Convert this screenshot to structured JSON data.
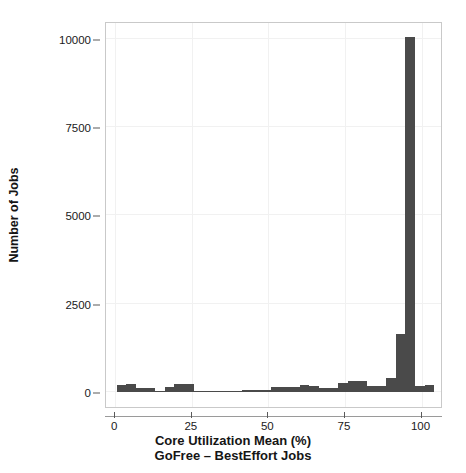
{
  "chart_data": {
    "type": "bar",
    "title": "",
    "subtitle": "",
    "xlabel": "Core Utilization Mean (%)",
    "xlabel_line2": "GoFree – BestEffort Jobs",
    "ylabel": "Number of Jobs",
    "grid": true,
    "legend": "none",
    "bar_color": "#4a4a4a",
    "frame_color": "#c9c9c9",
    "xlim": [
      -3,
      107
    ],
    "ylim": [
      0,
      10500
    ],
    "bin_width": 3.15,
    "xticks": [
      0,
      25,
      50,
      75,
      100
    ],
    "xtick_labels": [
      "0",
      "25",
      "50",
      "75",
      "100"
    ],
    "yticks": [
      0,
      2500,
      5000,
      7500,
      10000
    ],
    "ytick_labels": [
      "0",
      "2500",
      "5000",
      "7500",
      "10000"
    ],
    "bins": [
      {
        "x_start": 0.5,
        "x_end": 3.6,
        "center": 2.0,
        "value": 200
      },
      {
        "x_start": 3.6,
        "x_end": 6.7,
        "center": 5.2,
        "value": 215
      },
      {
        "x_start": 6.7,
        "x_end": 9.9,
        "center": 8.3,
        "value": 115
      },
      {
        "x_start": 9.9,
        "x_end": 13.0,
        "center": 11.5,
        "value": 100
      },
      {
        "x_start": 13.0,
        "x_end": 16.2,
        "center": 14.6,
        "value": 35
      },
      {
        "x_start": 16.2,
        "x_end": 19.3,
        "center": 17.7,
        "value": 150
      },
      {
        "x_start": 19.3,
        "x_end": 22.5,
        "center": 20.9,
        "value": 215
      },
      {
        "x_start": 22.5,
        "x_end": 25.6,
        "center": 24.0,
        "value": 215
      },
      {
        "x_start": 25.6,
        "x_end": 28.7,
        "center": 27.2,
        "value": 30
      },
      {
        "x_start": 28.7,
        "x_end": 31.9,
        "center": 30.3,
        "value": 30
      },
      {
        "x_start": 31.9,
        "x_end": 35.0,
        "center": 33.5,
        "value": 30
      },
      {
        "x_start": 35.0,
        "x_end": 38.2,
        "center": 36.6,
        "value": 30
      },
      {
        "x_start": 38.2,
        "x_end": 41.3,
        "center": 39.7,
        "value": 40
      },
      {
        "x_start": 41.3,
        "x_end": 44.5,
        "center": 42.9,
        "value": 50
      },
      {
        "x_start": 44.5,
        "x_end": 47.6,
        "center": 46.0,
        "value": 45
      },
      {
        "x_start": 47.6,
        "x_end": 50.7,
        "center": 49.2,
        "value": 45
      },
      {
        "x_start": 50.7,
        "x_end": 53.9,
        "center": 52.3,
        "value": 150
      },
      {
        "x_start": 53.9,
        "x_end": 57.0,
        "center": 55.5,
        "value": 150
      },
      {
        "x_start": 57.0,
        "x_end": 60.2,
        "center": 58.6,
        "value": 145
      },
      {
        "x_start": 60.2,
        "x_end": 63.3,
        "center": 61.7,
        "value": 190
      },
      {
        "x_start": 63.3,
        "x_end": 66.4,
        "center": 64.9,
        "value": 175
      },
      {
        "x_start": 66.4,
        "x_end": 69.6,
        "center": 68.0,
        "value": 120
      },
      {
        "x_start": 69.6,
        "x_end": 72.7,
        "center": 71.2,
        "value": 120
      },
      {
        "x_start": 72.7,
        "x_end": 75.9,
        "center": 74.3,
        "value": 265
      },
      {
        "x_start": 75.9,
        "x_end": 79.0,
        "center": 77.4,
        "value": 320
      },
      {
        "x_start": 79.0,
        "x_end": 82.2,
        "center": 80.6,
        "value": 310
      },
      {
        "x_start": 82.2,
        "x_end": 85.3,
        "center": 83.7,
        "value": 180
      },
      {
        "x_start": 85.3,
        "x_end": 88.4,
        "center": 86.9,
        "value": 180
      },
      {
        "x_start": 88.4,
        "x_end": 91.6,
        "center": 90.0,
        "value": 400
      },
      {
        "x_start": 91.6,
        "x_end": 94.7,
        "center": 93.2,
        "value": 1650
      },
      {
        "x_start": 94.7,
        "x_end": 97.9,
        "center": 96.3,
        "value": 10050
      },
      {
        "x_start": 97.9,
        "x_end": 101.0,
        "center": 99.4,
        "value": 160
      },
      {
        "x_start": 101.0,
        "x_end": 104.2,
        "center": 102.6,
        "value": 190
      }
    ]
  },
  "axes": {
    "y_title": "Number of Jobs",
    "x_title_line1": "Core Utilization Mean (%)",
    "x_title_line2": "GoFree – BestEffort Jobs"
  }
}
